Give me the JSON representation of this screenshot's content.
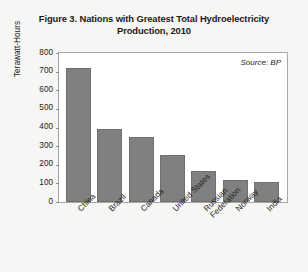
{
  "chart_data": {
    "type": "bar",
    "title": "Figure 3. Nations with Greatest Total Hydroelectricity Production, 2010",
    "title_lines": [
      "Figure 3. Nations with Greatest Total Hydroelectricity",
      "Production, 2010"
    ],
    "categories": [
      "China",
      "Brazil",
      "Canada",
      "United States",
      "Russian Federation",
      "Norway",
      "India"
    ],
    "values": [
      720,
      390,
      350,
      255,
      165,
      120,
      110
    ],
    "xlabel": "",
    "ylabel": "Terawatt-Hours",
    "ylim": [
      0,
      800
    ],
    "yticks": [
      800,
      700,
      600,
      500,
      400,
      300,
      200,
      100,
      0
    ],
    "grid": false,
    "legend": "none",
    "annotation": "Source: BP",
    "bar_color": "#808080",
    "plot_background": "#ffffff",
    "page_background": "#f6f6f4"
  }
}
